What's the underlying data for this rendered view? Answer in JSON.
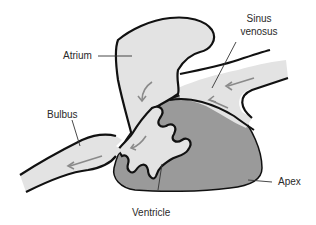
{
  "diagram": {
    "colors": {
      "background": "#ffffff",
      "light_tissue": "#e3e3e3",
      "ventricle_wall": "#9a9a9a",
      "outline": "#111111",
      "flow_arrow": "#8a8a8a",
      "leader_line": "#333333",
      "label_text": "#2a2a2a"
    },
    "labels": {
      "atrium": "Atrium",
      "sinus_venosus_line1": "Sinus",
      "sinus_venosus_line2": "venosus",
      "bulbus": "Bulbus",
      "ventricle": "Ventricle",
      "apex": "Apex"
    },
    "flow_arrows": [
      {
        "region": "sinus-venosus-upper",
        "direction": "left"
      },
      {
        "region": "sinus-venosus-lower",
        "direction": "up-left"
      },
      {
        "region": "atrium",
        "direction": "down"
      },
      {
        "region": "atrioventricular-canal",
        "direction": "down-left"
      },
      {
        "region": "bulbus",
        "direction": "left"
      }
    ]
  }
}
